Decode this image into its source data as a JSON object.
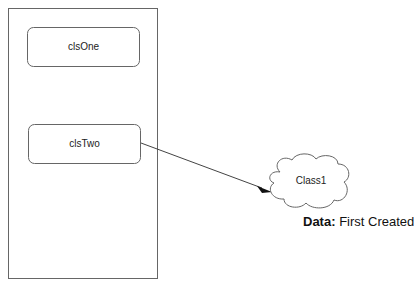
{
  "diagram": {
    "container": {
      "label": ""
    },
    "boxes": [
      {
        "id": "clsOne",
        "label": "clsOne"
      },
      {
        "id": "clsTwo",
        "label": "clsTwo"
      }
    ],
    "cloud": {
      "label": "Class1"
    },
    "annotation": {
      "key": "Data:",
      "value": "First Created"
    },
    "colors": {
      "stroke": "#555555",
      "arrow": "#111111",
      "background": "#ffffff"
    }
  }
}
